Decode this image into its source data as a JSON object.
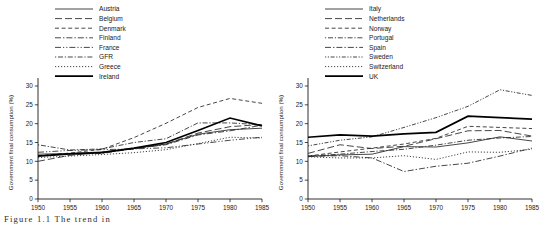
{
  "figure": {
    "caption": "Figure 1.1  The trend in",
    "axis": {
      "xticks": [
        1950,
        1955,
        1960,
        1965,
        1970,
        1975,
        1980,
        1985
      ],
      "yticks": [
        0,
        5,
        10,
        15,
        20,
        25,
        30
      ],
      "xlim": [
        1950,
        1985
      ],
      "ylim": [
        0,
        30
      ],
      "ylabel": "Government final consumption (%)",
      "xlabel": ""
    }
  },
  "chart_data": [
    {
      "type": "line",
      "panel": "left",
      "title": "",
      "xlabel": "",
      "ylabel": "Government final consumption (%)",
      "xlim": [
        1950,
        1985
      ],
      "ylim": [
        0,
        30
      ],
      "grid": false,
      "legend_position": "top-left",
      "x": [
        1950,
        1955,
        1960,
        1965,
        1970,
        1975,
        1980,
        1985
      ],
      "series": [
        {
          "name": "Austria",
          "dash": "none",
          "width": "thin",
          "values": [
            11.9,
            12.1,
            12.5,
            13.4,
            14.6,
            17.2,
            18.4,
            18.8
          ]
        },
        {
          "name": "Belgium",
          "dash": "long-dash",
          "width": "thin",
          "values": [
            10.0,
            11.6,
            12.4,
            13.3,
            14.6,
            17.5,
            19.2,
            19.8
          ]
        },
        {
          "name": "Denmark",
          "dash": "dash",
          "width": "thin",
          "values": [
            11.5,
            12.2,
            13.2,
            16.3,
            20.1,
            24.3,
            26.7,
            25.4
          ]
        },
        {
          "name": "Finland",
          "dash": "dash-dot",
          "width": "thin",
          "values": [
            11.5,
            11.9,
            12.1,
            13.4,
            14.4,
            17.0,
            18.1,
            19.6
          ]
        },
        {
          "name": "France",
          "dash": "dash-dot-dot",
          "width": "thin",
          "values": [
            12.4,
            12.9,
            13.1,
            13.3,
            13.6,
            14.6,
            15.6,
            16.4
          ]
        },
        {
          "name": "GFR",
          "dash": "dot-dash",
          "width": "thin",
          "values": [
            14.4,
            13.0,
            13.3,
            15.0,
            16.0,
            20.2,
            20.2,
            19.7
          ]
        },
        {
          "name": "Greece",
          "dash": "dot",
          "width": "thin",
          "values": [
            11.0,
            11.4,
            11.8,
            12.3,
            13.1,
            14.7,
            16.4,
            16.2
          ]
        },
        {
          "name": "Ireland",
          "dash": "none",
          "width": "thick",
          "values": [
            11.4,
            12.0,
            12.3,
            13.5,
            15.0,
            18.2,
            21.5,
            19.4
          ]
        }
      ]
    },
    {
      "type": "line",
      "panel": "right",
      "title": "",
      "xlabel": "",
      "ylabel": "Government final consumption (%)",
      "xlim": [
        1950,
        1985
      ],
      "ylim": [
        0,
        30
      ],
      "grid": false,
      "legend_position": "top-left",
      "x": [
        1950,
        1955,
        1960,
        1965,
        1970,
        1975,
        1980,
        1985
      ],
      "series": [
        {
          "name": "Italy",
          "dash": "none",
          "width": "thin",
          "values": [
            11.3,
            11.7,
            11.9,
            13.9,
            13.8,
            14.9,
            16.5,
            15.4
          ]
        },
        {
          "name": "Netherlands",
          "dash": "long-dash",
          "width": "thin",
          "values": [
            12.1,
            14.4,
            13.4,
            14.0,
            16.0,
            18.1,
            18.2,
            16.7
          ]
        },
        {
          "name": "Norway",
          "dash": "dash",
          "width": "thin",
          "values": [
            11.4,
            12.5,
            13.5,
            14.6,
            16.1,
            19.3,
            19.0,
            18.7
          ]
        },
        {
          "name": "Portugal",
          "dash": "dot-dash",
          "width": "thin",
          "values": [
            11.4,
            11.9,
            12.6,
            13.2,
            14.3,
            15.6,
            16.2,
            16.6
          ]
        },
        {
          "name": "Spain",
          "dash": "dash-dot",
          "width": "thin",
          "values": [
            11.3,
            11.5,
            10.9,
            7.3,
            8.7,
            9.5,
            11.4,
            13.5
          ]
        },
        {
          "name": "Sweden",
          "dash": "dot-dash-2",
          "width": "thin",
          "values": [
            14.1,
            15.6,
            16.5,
            19.0,
            21.6,
            24.6,
            29.0,
            27.5
          ]
        },
        {
          "name": "Switzerland",
          "dash": "dot",
          "width": "thin",
          "values": [
            11.2,
            10.9,
            10.9,
            11.5,
            10.5,
            12.5,
            12.4,
            13.2
          ]
        },
        {
          "name": "UK",
          "dash": "none",
          "width": "thick",
          "values": [
            16.4,
            17.0,
            16.7,
            17.3,
            17.7,
            22.0,
            21.6,
            21.2
          ]
        }
      ]
    }
  ]
}
